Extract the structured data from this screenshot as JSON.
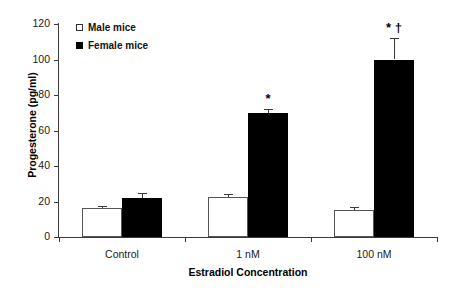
{
  "chart_data": {
    "type": "bar",
    "title": "",
    "xlabel": "Estradiol Concentration",
    "ylabel": "Progesterone (pg/ml)",
    "categories": [
      "Control",
      "1 nM",
      "100 nM"
    ],
    "ylim": [
      0,
      120
    ],
    "yticks": [
      0,
      20,
      40,
      60,
      80,
      100,
      120
    ],
    "ytick_labels": [
      "0",
      "20",
      "40",
      "60",
      "80",
      "100",
      "120"
    ],
    "grid": false,
    "legend_position": "upper-left-inside",
    "series": [
      {
        "name": "Male mice",
        "color": "#ffffff",
        "edge_color": "#555555",
        "values": [
          16.5,
          22.5,
          15.0
        ],
        "errors": [
          1.0,
          2.0,
          2.0
        ]
      },
      {
        "name": "Female mice",
        "color": "#000000",
        "edge_color": "#000000",
        "values": [
          22.0,
          70.0,
          100.0
        ],
        "errors": [
          3.0,
          2.0,
          12.0
        ]
      }
    ],
    "annotations": [
      {
        "text": "*",
        "category": "1 nM",
        "series": "Female mice"
      },
      {
        "text": "* †",
        "category": "100 nM",
        "series": "Female mice"
      }
    ]
  },
  "legend": {
    "items": [
      {
        "label": "Male mice",
        "swatch": "open-square-icon"
      },
      {
        "label": "Female mice",
        "swatch": "filled-square-icon"
      }
    ]
  },
  "axes": {
    "y_title": "Progesterone (pg/ml)",
    "x_title": "Estradiol Concentration"
  }
}
